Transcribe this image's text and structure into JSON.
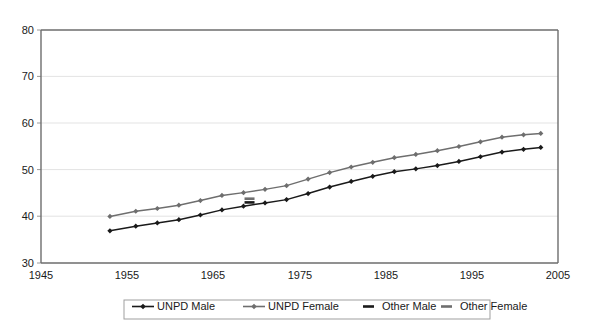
{
  "chart_data": {
    "type": "line",
    "title": "",
    "subtitle": "",
    "xlabel": "",
    "ylabel": "",
    "xlim": [
      1945,
      2005
    ],
    "ylim": [
      30,
      80
    ],
    "xticks": [
      1945,
      1955,
      1965,
      1975,
      1985,
      1995,
      2005
    ],
    "yticks": [
      30,
      40,
      50,
      60,
      70,
      80
    ],
    "grid": "horizontal",
    "legend_position": "bottom",
    "legend": [
      "UNPD Male",
      "UNPD Female",
      "Other Male",
      "Other Female"
    ],
    "series": [
      {
        "name": "UNPD Male",
        "color": "#1a1a1a",
        "marker": "diamond",
        "style": "solid",
        "x": [
          1953,
          1956,
          1958.5,
          1961,
          1963.5,
          1966,
          1968.5,
          1971,
          1973.5,
          1976,
          1978.5,
          1981,
          1983.5,
          1986,
          1988.5,
          1991,
          1993.5,
          1996,
          1998.5,
          2001,
          2003
        ],
        "values": [
          36.9,
          37.9,
          38.6,
          39.3,
          40.3,
          41.4,
          42.2,
          42.9,
          43.6,
          44.9,
          46.3,
          47.5,
          48.6,
          49.6,
          50.2,
          50.9,
          51.8,
          52.8,
          53.8,
          54.4,
          54.8
        ]
      },
      {
        "name": "UNPD Female",
        "color": "#6e6e6e",
        "marker": "diamond",
        "style": "solid",
        "x": [
          1953,
          1956,
          1958.5,
          1961,
          1963.5,
          1966,
          1968.5,
          1971,
          1973.5,
          1976,
          1978.5,
          1981,
          1983.5,
          1986,
          1988.5,
          1991,
          1993.5,
          1996,
          1998.5,
          2001,
          2003
        ],
        "values": [
          40.0,
          41.1,
          41.7,
          42.4,
          43.4,
          44.5,
          45.1,
          45.8,
          46.6,
          48.0,
          49.4,
          50.6,
          51.6,
          52.6,
          53.3,
          54.1,
          55.0,
          56.0,
          57.0,
          57.5,
          57.8
        ]
      },
      {
        "name": "Other Male",
        "color": "#1a1a1a",
        "marker": "dash",
        "style": "dashed",
        "x": [
          1969.2
        ],
        "values": [
          43.0
        ]
      },
      {
        "name": "Other Female",
        "color": "#6e6e6e",
        "marker": "dash",
        "style": "dashed",
        "x": [
          1969.2
        ],
        "values": [
          43.8
        ]
      }
    ]
  },
  "axes": {
    "y_tick_labels": [
      "80",
      "70",
      "60",
      "50",
      "40",
      "30"
    ],
    "x_tick_labels": [
      "1945",
      "1955",
      "1965",
      "1975",
      "1985",
      "1995",
      "2005"
    ]
  },
  "legend": {
    "items": [
      {
        "label": "UNPD Male",
        "color": "#1a1a1a",
        "marker": "diamond-line"
      },
      {
        "label": "UNPD Female",
        "color": "#6e6e6e",
        "marker": "diamond-line"
      },
      {
        "label": "Other Male",
        "color": "#1a1a1a",
        "marker": "short-dash"
      },
      {
        "label": "Other Female",
        "color": "#6e6e6e",
        "marker": "short-dash"
      }
    ]
  },
  "colors": {
    "male": "#1a1a1a",
    "female": "#6e6e6e",
    "grid": "#e3e3e3",
    "axis": "#6d6d6d",
    "background": "#ffffff"
  }
}
